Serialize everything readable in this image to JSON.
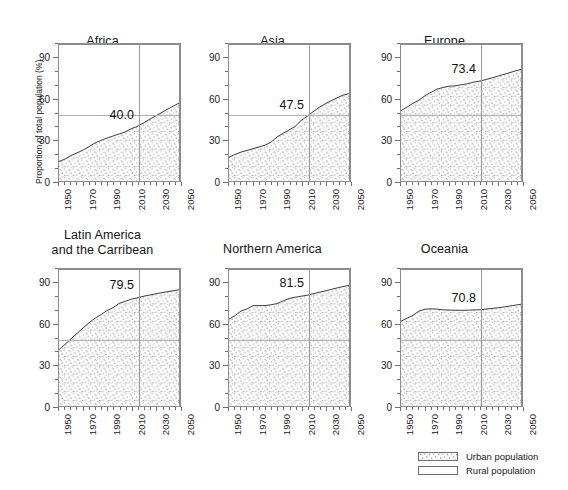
{
  "figure": {
    "ylabel": "Proportion of total population (%)",
    "y_ticks": [
      "0",
      "30",
      "60",
      "90"
    ],
    "x_ticks": [
      "1950",
      "1970",
      "1990",
      "2010",
      "2030",
      "2050"
    ]
  },
  "legend": {
    "urban_label": "Urban population",
    "rural_label": "Rural population",
    "urban_swatch": "stipple-swatch",
    "rural_swatch": "blank-swatch"
  },
  "chart_data": {
    "type": "area",
    "title": "",
    "xlabel": "",
    "ylabel": "Proportion of total population (%)",
    "xlim": [
      1950,
      2050
    ],
    "ylim": [
      0,
      100
    ],
    "grid": false,
    "legend_position": "bottom-right",
    "reference_lines": {
      "horizontal_value": 50,
      "vertical_value": 2015
    },
    "x": [
      1950,
      1955,
      1960,
      1965,
      1970,
      1975,
      1980,
      1985,
      1990,
      1995,
      2000,
      2005,
      2010,
      2015,
      2020,
      2025,
      2030,
      2035,
      2040,
      2045,
      2050
    ],
    "panels": [
      {
        "name": "Africa",
        "title": "Africa",
        "annotation": "40.0",
        "annotation_year": 2015,
        "series": [
          {
            "name": "Urban population",
            "values": [
              14.3,
              16.0,
              18.6,
              20.6,
              22.6,
              25.2,
              27.9,
              29.8,
              31.5,
              33.0,
              34.5,
              36.0,
              38.3,
              40.0,
              42.5,
              45.1,
              47.6,
              50.1,
              52.6,
              55.0,
              57.3
            ]
          }
        ]
      },
      {
        "name": "Asia",
        "title": "Asia",
        "annotation": "47.5",
        "annotation_year": 2015,
        "series": [
          {
            "name": "Urban population",
            "values": [
              17.5,
              19.4,
              21.2,
              22.4,
              23.7,
              25.0,
              26.3,
              28.5,
              32.3,
              35.0,
              37.5,
              40.0,
              44.4,
              47.5,
              50.9,
              54.1,
              56.7,
              59.0,
              61.2,
              63.2,
              64.2
            ]
          }
        ]
      },
      {
        "name": "Europe",
        "title": "Europe",
        "annotation": "73.4",
        "annotation_year": 2015,
        "series": [
          {
            "name": "Urban population",
            "values": [
              51.7,
              54.4,
              57.1,
              59.6,
              62.8,
              65.3,
              67.6,
              68.8,
              69.8,
              70.0,
              70.8,
              71.5,
              72.7,
              73.4,
              74.5,
              75.7,
              77.0,
              78.3,
              79.6,
              81.0,
              82.2
            ]
          }
        ]
      },
      {
        "name": "Latin America and the Carribean",
        "title": "Latin America\nand the Carribean",
        "annotation": "79.5",
        "annotation_year": 2015,
        "series": [
          {
            "name": "Urban population",
            "values": [
              41.3,
              45.3,
              49.4,
              53.4,
              57.3,
              61.2,
              64.6,
              67.2,
              70.3,
              72.3,
              75.5,
              77.0,
              78.6,
              79.5,
              80.7,
              81.6,
              82.5,
              83.3,
              84.1,
              84.8,
              85.6
            ]
          }
        ]
      },
      {
        "name": "Northern America",
        "title": "Northern America",
        "annotation": "81.5",
        "annotation_year": 2015,
        "series": [
          {
            "name": "Urban population",
            "values": [
              63.9,
              66.5,
              69.9,
              71.4,
              73.8,
              73.9,
              73.9,
              74.5,
              75.4,
              77.3,
              79.1,
              80.0,
              80.8,
              81.5,
              82.6,
              83.7,
              84.7,
              85.8,
              86.9,
              87.9,
              88.8
            ]
          }
        ]
      },
      {
        "name": "Oceania",
        "title": "Oceania",
        "annotation": "70.8",
        "annotation_year": 2015,
        "series": [
          {
            "name": "Urban population",
            "values": [
              62.4,
              64.6,
              66.7,
              69.9,
              71.2,
              71.5,
              71.3,
              70.8,
              70.6,
              70.5,
              70.4,
              70.5,
              70.7,
              70.8,
              71.2,
              71.7,
              72.2,
              72.8,
              73.5,
              74.2,
              74.9
            ]
          }
        ]
      }
    ]
  }
}
